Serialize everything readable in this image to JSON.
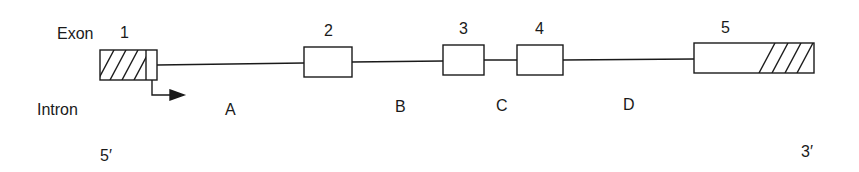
{
  "diagram": {
    "row_labels": {
      "exon": "Exon",
      "intron": "Intron"
    },
    "ends": {
      "five_prime": "5′",
      "three_prime": "3′"
    },
    "exons": [
      {
        "label": "1",
        "x": 100,
        "y": 50,
        "w": 57,
        "h": 30,
        "hatch": "left",
        "hatch_end": 146
      },
      {
        "label": "2",
        "x": 304,
        "y": 47,
        "w": 48,
        "h": 30,
        "hatch": "none"
      },
      {
        "label": "3",
        "x": 443,
        "y": 45,
        "w": 41,
        "h": 30,
        "hatch": "none"
      },
      {
        "label": "4",
        "x": 517,
        "y": 45,
        "w": 46,
        "h": 30,
        "hatch": "none"
      },
      {
        "label": "5",
        "x": 694,
        "y": 43,
        "w": 120,
        "h": 30,
        "hatch": "right",
        "hatch_start": 758
      }
    ],
    "introns": [
      {
        "label": "A"
      },
      {
        "label": "B"
      },
      {
        "label": "C"
      },
      {
        "label": "D"
      }
    ],
    "transcription_start_arrow": "right-arrow",
    "line_color": "#1a1a1a"
  }
}
